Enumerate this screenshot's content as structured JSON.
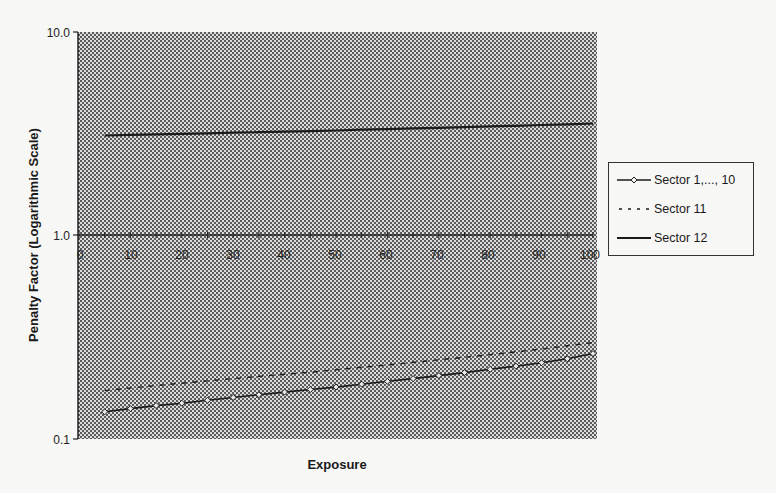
{
  "chart_data": {
    "type": "line",
    "title": "",
    "xlabel": "Exposure",
    "ylabel": "Penalty Factor (Logarithmic Scale)",
    "y_scale": "log",
    "ylim": [
      0.1,
      10.0
    ],
    "xlim": [
      0,
      100
    ],
    "y_ticks": [
      "10.0",
      "1.0",
      "0.1"
    ],
    "x_ticks": [
      "0",
      "10",
      "20",
      "30",
      "40",
      "50",
      "60",
      "70",
      "80",
      "90",
      "100"
    ],
    "x_axis_crosses_at_y": 1.0,
    "grid": false,
    "background": "stippled gray",
    "legend_position": "right",
    "x": [
      5,
      10,
      15,
      20,
      25,
      30,
      35,
      40,
      45,
      50,
      55,
      60,
      65,
      70,
      75,
      80,
      85,
      90,
      95,
      100
    ],
    "series": [
      {
        "name": "Sector 1,..., 10",
        "style": "solid line with small diamond markers",
        "values": [
          0.136,
          0.141,
          0.146,
          0.15,
          0.155,
          0.16,
          0.165,
          0.17,
          0.175,
          0.18,
          0.186,
          0.192,
          0.198,
          0.205,
          0.212,
          0.22,
          0.228,
          0.237,
          0.248,
          0.263
        ]
      },
      {
        "name": "Sector 11",
        "style": "dashed line",
        "values": [
          0.173,
          0.178,
          0.183,
          0.188,
          0.193,
          0.198,
          0.203,
          0.208,
          0.213,
          0.219,
          0.225,
          0.231,
          0.238,
          0.245,
          0.252,
          0.26,
          0.268,
          0.277,
          0.287,
          0.298
        ]
      },
      {
        "name": "Sector 12",
        "style": "solid thick line",
        "values": [
          3.1,
          3.12,
          3.14,
          3.16,
          3.18,
          3.2,
          3.22,
          3.24,
          3.26,
          3.28,
          3.31,
          3.33,
          3.36,
          3.38,
          3.41,
          3.44,
          3.46,
          3.49,
          3.52,
          3.55
        ]
      }
    ]
  },
  "axes": {
    "y_title": "Penalty Factor (Logarithmic Scale)",
    "x_title": "Exposure",
    "y_labels": [
      "10.0",
      "1.0",
      "0.1"
    ],
    "x_labels": [
      "0",
      "10",
      "20",
      "30",
      "40",
      "50",
      "60",
      "70",
      "80",
      "90",
      "100"
    ]
  },
  "legend": {
    "items": [
      {
        "label": "Sector 1,..., 10"
      },
      {
        "label": "Sector 11"
      },
      {
        "label": "Sector 12"
      }
    ]
  },
  "colors": {
    "line": "#1a1a1a",
    "plot_bg_light": "#d9d9d9",
    "plot_bg_dot": "#6a6a6a",
    "page_bg": "#f7f7f5"
  }
}
